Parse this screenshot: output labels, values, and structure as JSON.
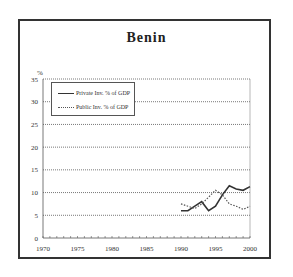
{
  "chart_data": {
    "type": "line",
    "title": "Benin",
    "xlabel": "",
    "ylabel": "%",
    "xlim": [
      1970,
      2000
    ],
    "ylim": [
      0,
      35
    ],
    "x_ticks": [
      1970,
      1975,
      1980,
      1985,
      1990,
      1995,
      2000
    ],
    "y_ticks": [
      0,
      5,
      10,
      15,
      20,
      25,
      30,
      35
    ],
    "grid": "horizontal dotted",
    "legend_position": "upper-left",
    "x": [
      1990,
      1991,
      1992,
      1993,
      1994,
      1995,
      1996,
      1997,
      1998,
      1999,
      2000
    ],
    "series": [
      {
        "name": "Private Inv. % of GDP",
        "style": "solid",
        "values": [
          6.0,
          6.0,
          7.0,
          8.0,
          6.0,
          7.0,
          9.5,
          11.5,
          10.8,
          10.5,
          11.3
        ]
      },
      {
        "name": "Public Inv. % of GDP",
        "style": "dotted",
        "values": [
          7.5,
          7.0,
          6.5,
          7.5,
          9.0,
          10.5,
          9.5,
          7.5,
          7.0,
          6.3,
          7.0
        ]
      }
    ]
  },
  "legend": {
    "private": "Private Inv. % of GDP",
    "public": "Public Inv. % of GDP"
  },
  "colors": {
    "line": "#333333",
    "grid": "#555555"
  }
}
